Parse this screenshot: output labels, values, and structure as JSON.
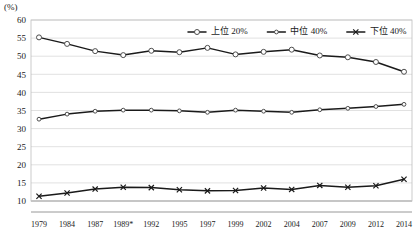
{
  "axis_unit_label": "(%)",
  "chart_data": {
    "type": "line",
    "title": "",
    "subtitle": "",
    "xlabel": "",
    "ylabel": "",
    "unit": "(%)",
    "grid": true,
    "legend_position": "top-right",
    "ylim": [
      10,
      60
    ],
    "ytick_step": 5,
    "yticks": [
      10,
      15,
      20,
      25,
      30,
      35,
      40,
      45,
      50,
      55,
      60
    ],
    "ytick_labels": [
      "10",
      "15",
      "20",
      "25",
      "30",
      "35",
      "40",
      "45",
      "50",
      "55",
      "60"
    ],
    "categories": [
      "1979",
      "1984",
      "1987",
      "1989*",
      "1992",
      "1995",
      "1997",
      "1999",
      "2002",
      "2004",
      "2007",
      "2009",
      "2012",
      "2014"
    ],
    "series": [
      {
        "name": "上位 20%",
        "marker": "open-circle",
        "values": [
          55.2,
          53.4,
          51.4,
          50.3,
          51.5,
          51.1,
          52.3,
          50.5,
          51.2,
          51.8,
          50.2,
          49.7,
          48.4,
          45.7
        ]
      },
      {
        "name": "中位 40%",
        "marker": "small-open-circle",
        "values": [
          32.6,
          34.0,
          34.8,
          35.1,
          35.1,
          34.9,
          34.5,
          35.1,
          34.8,
          34.5,
          35.2,
          35.6,
          36.1,
          36.7
        ]
      },
      {
        "name": "下位 40%",
        "marker": "cross",
        "values": [
          11.3,
          12.2,
          13.3,
          13.8,
          13.7,
          13.1,
          12.8,
          12.9,
          13.6,
          13.2,
          14.3,
          13.8,
          14.2,
          16.0
        ]
      }
    ],
    "legend": [
      {
        "label": "上位 20%",
        "marker": "open-circle"
      },
      {
        "label": "中位 40%",
        "marker": "small-open-circle"
      },
      {
        "label": "下位 40%",
        "marker": "cross"
      }
    ],
    "colors": {
      "line": "#1a1a1a",
      "grid": "#d9d9d9",
      "axis": "#8c8c8c",
      "marker_fill": "#ffffff",
      "text": "#1a1a1a"
    }
  }
}
